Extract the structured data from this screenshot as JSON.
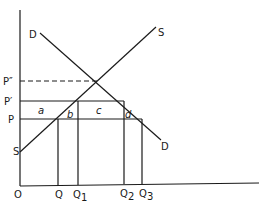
{
  "diagram": {
    "type": "supply-demand",
    "curves": {
      "demand": {
        "label_top": "D",
        "label_bottom": "D"
      },
      "supply": {
        "label_top": "S",
        "label_bottom": "S"
      }
    },
    "price_labels": {
      "p_double_prime": "P″",
      "p_prime": "P′",
      "p": "P"
    },
    "quantity_labels": {
      "origin": "O",
      "q": "Q",
      "q1": "Q",
      "q1_sub": "1",
      "q2": "Q",
      "q2_sub": "2",
      "q3": "Q",
      "q3_sub": "3"
    },
    "area_labels": {
      "a": "a",
      "b": "b",
      "c": "c",
      "d": "d"
    }
  }
}
